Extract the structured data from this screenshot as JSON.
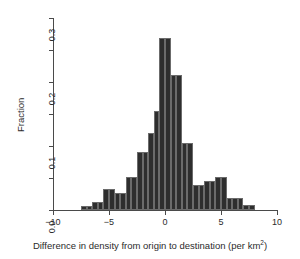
{
  "chart_data": {
    "type": "bar",
    "title": "",
    "subtitle": "",
    "xlabel": "Difference in density from origin to destination (per km²)",
    "xlabel_main": "Difference in density from origin to destination (per km",
    "xlabel_sup": "2",
    "xlabel_tail": ")",
    "ylabel": "Fraction",
    "xlim": [
      -10,
      10
    ],
    "ylim": [
      0,
      0.3
    ],
    "bin_width": 0.5,
    "grid": false,
    "legend": null,
    "bar_color": "#2e2e2e",
    "bar_edge_color": "#6b6b6b",
    "axis_color": "#4a4a4a",
    "xticks": [
      -10,
      -5,
      0,
      5,
      10
    ],
    "xtick_labels": [
      "−10",
      "−5",
      "0",
      "5",
      "10"
    ],
    "yticks": [
      0.0,
      0.05,
      0.1,
      0.15,
      0.2,
      0.25,
      0.3
    ],
    "ytick_labels": [
      "0.0",
      "",
      "0.1",
      "",
      "0.2",
      "",
      "0.3"
    ],
    "bins": [
      {
        "x0": -7.5,
        "x1": -7.0,
        "value": 0.006
      },
      {
        "x0": -7.0,
        "x1": -6.5,
        "value": 0.006
      },
      {
        "x0": -6.5,
        "x1": -6.0,
        "value": 0.012
      },
      {
        "x0": -6.0,
        "x1": -5.5,
        "value": 0.012
      },
      {
        "x0": -5.5,
        "x1": -5.0,
        "value": 0.033
      },
      {
        "x0": -5.0,
        "x1": -4.5,
        "value": 0.033
      },
      {
        "x0": -4.5,
        "x1": -4.0,
        "value": 0.026
      },
      {
        "x0": -4.0,
        "x1": -3.5,
        "value": 0.026
      },
      {
        "x0": -3.5,
        "x1": -3.0,
        "value": 0.052
      },
      {
        "x0": -3.0,
        "x1": -2.5,
        "value": 0.052
      },
      {
        "x0": -2.5,
        "x1": -2.0,
        "value": 0.09
      },
      {
        "x0": -2.0,
        "x1": -1.5,
        "value": 0.09
      },
      {
        "x0": -1.5,
        "x1": -1.0,
        "value": 0.12
      },
      {
        "x0": -1.0,
        "x1": -0.5,
        "value": 0.155
      },
      {
        "x0": -0.5,
        "x1": 0.0,
        "value": 0.268
      },
      {
        "x0": 0.0,
        "x1": 0.5,
        "value": 0.268
      },
      {
        "x0": 0.5,
        "x1": 1.0,
        "value": 0.211
      },
      {
        "x0": 1.0,
        "x1": 1.5,
        "value": 0.211
      },
      {
        "x0": 1.5,
        "x1": 2.0,
        "value": 0.104
      },
      {
        "x0": 2.0,
        "x1": 2.5,
        "value": 0.104
      },
      {
        "x0": 2.5,
        "x1": 3.0,
        "value": 0.039
      },
      {
        "x0": 3.0,
        "x1": 3.5,
        "value": 0.039
      },
      {
        "x0": 3.5,
        "x1": 4.0,
        "value": 0.046
      },
      {
        "x0": 4.0,
        "x1": 4.5,
        "value": 0.046
      },
      {
        "x0": 4.5,
        "x1": 5.0,
        "value": 0.052
      },
      {
        "x0": 5.0,
        "x1": 5.5,
        "value": 0.052
      },
      {
        "x0": 5.5,
        "x1": 6.0,
        "value": 0.018
      },
      {
        "x0": 6.0,
        "x1": 6.5,
        "value": 0.018
      },
      {
        "x0": 6.5,
        "x1": 7.0,
        "value": 0.018
      },
      {
        "x0": 7.0,
        "x1": 7.5,
        "value": 0.008
      },
      {
        "x0": 7.5,
        "x1": 8.0,
        "value": 0.008
      }
    ]
  },
  "geometry": {
    "x_origin_px": 53,
    "y_origin_px": 210,
    "px_per_x_unit": 11.2,
    "px_per_y_unit": 640,
    "y_top_px": 18
  }
}
